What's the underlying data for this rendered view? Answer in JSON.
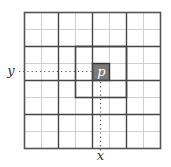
{
  "diagram": {
    "grid": {
      "cols": 8,
      "rows": 8,
      "origin_x": 24,
      "origin_y": 12,
      "cell_size": 17,
      "major_every": 2,
      "minor_color": "#cfcfcf",
      "major_color": "#444444",
      "border_color": "#555555"
    },
    "neighborhood": {
      "col_start": 3,
      "row_start": 2,
      "size": 3,
      "color": "#444444"
    },
    "pixel": {
      "label": "p",
      "col": 4,
      "row": 3,
      "fill": "#7a7a7a",
      "text_color": "#ffffff"
    },
    "axis_labels": {
      "y": "y",
      "x": "x"
    },
    "guide_color": "#555555"
  }
}
